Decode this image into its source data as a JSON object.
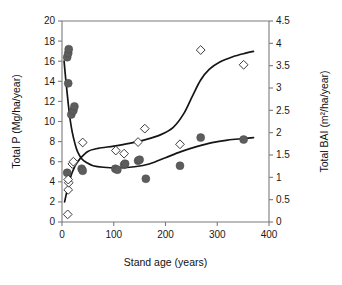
{
  "chart_data": {
    "type": "scatter",
    "title": "",
    "xlabel": "Stand age (years)",
    "ylabel": "Total P (Mg/ha/year)",
    "y2label": "Total BAI (m²/ha/year)",
    "xlim": [
      0,
      400
    ],
    "xticks": [
      0,
      100,
      200,
      300,
      400
    ],
    "xticklabels": [
      "0",
      "100",
      "200",
      "300",
      "400"
    ],
    "ylim": [
      0,
      20
    ],
    "yticks": [
      0,
      2,
      4,
      6,
      8,
      10,
      12,
      14,
      16,
      18,
      20
    ],
    "yticklabels": [
      "0",
      "2",
      "4",
      "6",
      "8",
      "10",
      "12",
      "14",
      "16",
      "18",
      "20"
    ],
    "y2lim": [
      0,
      4.5
    ],
    "y2ticks": [
      0,
      0.5,
      1,
      1.5,
      2,
      2.5,
      3,
      3.5,
      4,
      4.5
    ],
    "y2ticklabels": [
      "0",
      "0.5",
      "1",
      "1.5",
      "2",
      "2.5",
      "3",
      "3.5",
      "4",
      "4.5"
    ],
    "grid": false,
    "legend": "none",
    "series": [
      {
        "name": "Total P",
        "axis": "left",
        "marker": "filled-circle",
        "color": "#5d5d5d",
        "points": [
          {
            "x": 10,
            "y": 16.4
          },
          {
            "x": 12,
            "y": 16.8
          },
          {
            "x": 13,
            "y": 17.2
          },
          {
            "x": 12,
            "y": 13.8
          },
          {
            "x": 18,
            "y": 10.7
          },
          {
            "x": 22,
            "y": 11.1
          },
          {
            "x": 24,
            "y": 11.5
          },
          {
            "x": 10,
            "y": 4.9
          },
          {
            "x": 38,
            "y": 5.3
          },
          {
            "x": 40,
            "y": 5.1
          },
          {
            "x": 103,
            "y": 5.3
          },
          {
            "x": 107,
            "y": 5.2
          },
          {
            "x": 120,
            "y": 5.7
          },
          {
            "x": 122,
            "y": 5.8
          },
          {
            "x": 147,
            "y": 6.1
          },
          {
            "x": 150,
            "y": 6.2
          },
          {
            "x": 162,
            "y": 4.3
          },
          {
            "x": 228,
            "y": 5.6
          },
          {
            "x": 268,
            "y": 8.4
          },
          {
            "x": 351,
            "y": 8.2
          }
        ]
      },
      {
        "name": "Total BAI",
        "axis": "right",
        "marker": "open-diamond",
        "color": "#3c3c3c",
        "points": [
          {
            "x": 11,
            "y": 0.17
          },
          {
            "x": 12,
            "y": 0.72
          },
          {
            "x": 13,
            "y": 0.88
          },
          {
            "x": 12,
            "y": 0.95
          },
          {
            "x": 20,
            "y": 1.3
          },
          {
            "x": 22,
            "y": 1.35
          },
          {
            "x": 40,
            "y": 1.78
          },
          {
            "x": 104,
            "y": 1.6
          },
          {
            "x": 120,
            "y": 1.53
          },
          {
            "x": 147,
            "y": 1.79
          },
          {
            "x": 160,
            "y": 2.09
          },
          {
            "x": 228,
            "y": 1.74
          },
          {
            "x": 268,
            "y": 3.85
          },
          {
            "x": 351,
            "y": 3.52
          }
        ]
      }
    ],
    "fits": [
      {
        "name": "Total P fit",
        "axis": "left",
        "description": "steeply decaying curve from ~16 at age 5 to asymptote near 5.5",
        "path": [
          {
            "x": 4,
            "y": 16.0
          },
          {
            "x": 8,
            "y": 13.8
          },
          {
            "x": 12,
            "y": 11.8
          },
          {
            "x": 16,
            "y": 10.1
          },
          {
            "x": 20,
            "y": 8.9
          },
          {
            "x": 25,
            "y": 7.8
          },
          {
            "x": 30,
            "y": 7.0
          },
          {
            "x": 38,
            "y": 6.3
          },
          {
            "x": 48,
            "y": 5.9
          },
          {
            "x": 60,
            "y": 5.6
          },
          {
            "x": 80,
            "y": 5.45
          },
          {
            "x": 110,
            "y": 5.4
          },
          {
            "x": 140,
            "y": 5.5
          },
          {
            "x": 170,
            "y": 5.8
          },
          {
            "x": 200,
            "y": 6.4
          },
          {
            "x": 230,
            "y": 7.0
          },
          {
            "x": 260,
            "y": 7.5
          },
          {
            "x": 290,
            "y": 7.9
          },
          {
            "x": 320,
            "y": 8.15
          },
          {
            "x": 350,
            "y": 8.3
          },
          {
            "x": 370,
            "y": 8.4
          }
        ]
      },
      {
        "name": "Total BAI fit",
        "axis": "right",
        "description": "sigmoidal rise from ~0.45 at age 5 to ~3.8 at age 370",
        "path": [
          {
            "x": 5,
            "y": 0.45
          },
          {
            "x": 15,
            "y": 0.95
          },
          {
            "x": 25,
            "y": 1.25
          },
          {
            "x": 35,
            "y": 1.42
          },
          {
            "x": 50,
            "y": 1.58
          },
          {
            "x": 70,
            "y": 1.65
          },
          {
            "x": 100,
            "y": 1.7
          },
          {
            "x": 130,
            "y": 1.76
          },
          {
            "x": 160,
            "y": 1.84
          },
          {
            "x": 190,
            "y": 1.95
          },
          {
            "x": 215,
            "y": 2.12
          },
          {
            "x": 235,
            "y": 2.42
          },
          {
            "x": 252,
            "y": 2.82
          },
          {
            "x": 268,
            "y": 3.18
          },
          {
            "x": 285,
            "y": 3.42
          },
          {
            "x": 305,
            "y": 3.58
          },
          {
            "x": 330,
            "y": 3.7
          },
          {
            "x": 355,
            "y": 3.78
          },
          {
            "x": 370,
            "y": 3.82
          }
        ]
      }
    ]
  },
  "axes": {
    "x_title": "Stand age (years)",
    "y_left_title": "Total P (Mg/ha/year)",
    "y_right_title": "Total BAI (m²/ha/year)"
  },
  "colors": {
    "circle_fill": "#5d5d5d",
    "diamond_stroke": "#3c3c3c",
    "curve": "#151515",
    "axis": "#7b7b7b",
    "text": "#1a1a1a",
    "background": "#ffffff"
  }
}
